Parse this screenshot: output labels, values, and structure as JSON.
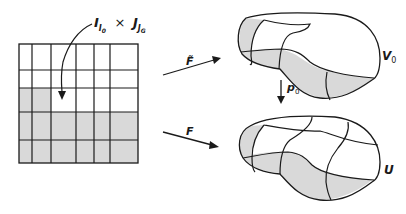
{
  "diagram": {
    "grid_label": {
      "main": "I",
      "main_sub": "I₀",
      "times": "×",
      "second": "J",
      "second_sub": "Jᴳ"
    },
    "arrow_top_label": "F̃",
    "arrow_bottom_label": "F",
    "projection_label": "p",
    "projection_sub": "0",
    "top_set_label": "V",
    "top_set_sub": "0",
    "bottom_set_label": "U",
    "grid": {
      "columns_x": [
        19,
        32,
        51,
        76,
        94,
        110,
        138
      ],
      "rows_y": [
        44,
        70,
        88,
        112,
        140,
        163
      ],
      "shaded_cells_note": "row 3 columns 1-2, rows 4-5 all columns"
    },
    "colors": {
      "stroke": "#1a1a1a",
      "shade": "#d9d9d9",
      "background": "#ffffff"
    }
  }
}
